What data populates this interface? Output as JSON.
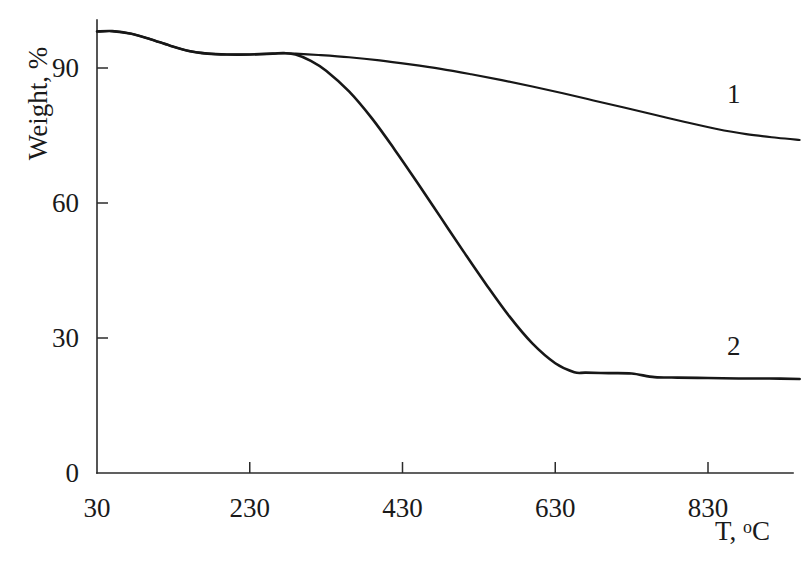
{
  "chart_data": {
    "type": "line",
    "title": "",
    "xlabel": "T, °C",
    "ylabel": "Weight, %",
    "xlim": [
      30,
      950
    ],
    "ylim": [
      0,
      100
    ],
    "xticks": [
      30,
      230,
      430,
      630,
      830
    ],
    "xtick_labels": [
      "30",
      "230",
      "430",
      "630",
      "830"
    ],
    "yticks": [
      0,
      30,
      60,
      90
    ],
    "ytick_labels": [
      "0",
      "30",
      "60",
      "90"
    ],
    "grid": false,
    "legend": "inline-curve-labels",
    "series": [
      {
        "name": "1",
        "label": "1",
        "x": [
          30,
          50,
          75,
          100,
          125,
          150,
          175,
          200,
          230,
          260,
          275,
          290,
          320,
          360,
          400,
          440,
          480,
          520,
          560,
          600,
          640,
          680,
          720,
          760,
          800,
          840,
          880,
          920,
          950
        ],
        "y": [
          98.1,
          98.2,
          97.6,
          96.4,
          95.0,
          93.8,
          93.2,
          93.0,
          93.0,
          93.2,
          93.3,
          93.2,
          92.9,
          92.4,
          91.7,
          90.8,
          89.8,
          88.6,
          87.3,
          85.9,
          84.4,
          82.8,
          81.2,
          79.6,
          78.0,
          76.5,
          75.3,
          74.5,
          74.0
        ]
      },
      {
        "name": "2",
        "label": "2",
        "x": [
          30,
          50,
          75,
          100,
          125,
          150,
          175,
          200,
          230,
          260,
          275,
          290,
          310,
          330,
          360,
          390,
          420,
          450,
          480,
          510,
          540,
          570,
          600,
          630,
          655,
          670,
          700,
          730,
          760,
          790,
          830,
          870,
          910,
          950
        ],
        "y": [
          98.1,
          98.2,
          97.6,
          96.4,
          95.0,
          93.8,
          93.2,
          93.0,
          93.0,
          93.2,
          93.3,
          93.0,
          91.6,
          89.4,
          84.8,
          78.8,
          71.8,
          64.4,
          56.8,
          49.2,
          41.8,
          34.8,
          28.8,
          24.4,
          22.4,
          22.3,
          22.2,
          22.1,
          21.3,
          21.2,
          21.1,
          21.0,
          21.0,
          20.9
        ]
      }
    ],
    "annotations": [
      {
        "text": "1",
        "x": 855,
        "y": 84
      },
      {
        "text": "2",
        "x": 855,
        "y": 28
      }
    ]
  },
  "axes": {
    "y_title": "Weight, %",
    "x_title_prefix": "T, ",
    "x_title_degree": "o",
    "x_title_suffix": "C"
  },
  "colors": {
    "curve": "#171717",
    "axis": "#2b2b2b",
    "background": "#ffffff",
    "text": "#1a1a1a"
  }
}
